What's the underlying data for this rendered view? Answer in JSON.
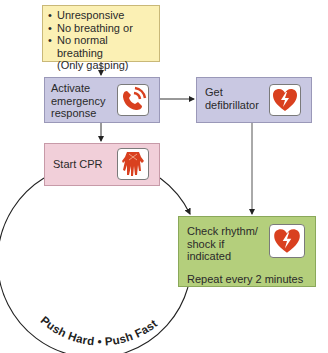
{
  "diagram": {
    "start_box": {
      "bullets": [
        "Unresponsive",
        "No breathing or",
        "No normal breathing"
      ],
      "note": "(Only gasping)"
    },
    "activate_box": {
      "lines": [
        "Activate",
        "emergency",
        "response"
      ],
      "icon": "phone-icon"
    },
    "defib_box": {
      "lines": [
        "Get",
        "defibrillator"
      ],
      "icon": "heart-shock-icon"
    },
    "cpr_box": {
      "label": "Start CPR",
      "icon": "hands-icon"
    },
    "check_box": {
      "lines": [
        "Check rhythm/",
        "shock if",
        "indicated"
      ],
      "repeat": "Repeat every 2 minutes",
      "icon": "heart-shock-icon"
    },
    "circle_text": "Push Hard • Push Fast",
    "colors": {
      "start": "#fbf0b4",
      "activate": "#c9c8e2",
      "defib": "#c9c8e2",
      "cpr": "#f1cfd9",
      "check": "#b4cf7c",
      "icon_red": "#d9401f"
    }
  }
}
